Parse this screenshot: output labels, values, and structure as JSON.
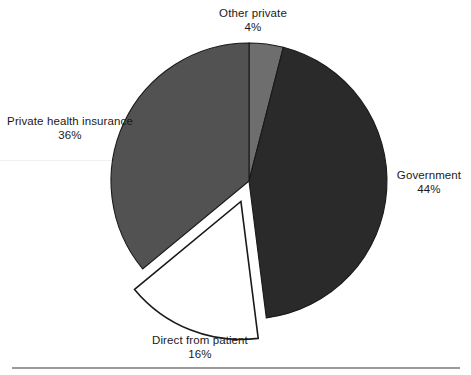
{
  "chart_data": {
    "type": "pie",
    "title": "",
    "subtitle": "",
    "xlabel": "",
    "ylabel": "",
    "legend_position": "none",
    "grid": false,
    "units": "percent",
    "total": 100,
    "start_angle_deg": 0,
    "direction": "clockwise",
    "categories": [
      "Other private",
      "Government",
      "Direct from patient",
      "Private health insurance"
    ],
    "values": [
      4,
      44,
      16,
      36
    ],
    "slices": [
      {
        "label": "Other private",
        "value": 4,
        "value_text": "4%",
        "color": "#6e6e6e",
        "exploded": false,
        "start_angle_deg": 0,
        "end_angle_deg": 14.4,
        "label_position": "top"
      },
      {
        "label": "Government",
        "value": 44,
        "value_text": "44%",
        "color": "#2a2a2a",
        "exploded": false,
        "start_angle_deg": 14.4,
        "end_angle_deg": 172.8,
        "label_position": "right"
      },
      {
        "label": "Direct from patient",
        "value": 16,
        "value_text": "16%",
        "color": "#ffffff",
        "stroke": "#1a1a1a",
        "exploded": true,
        "start_angle_deg": 172.8,
        "end_angle_deg": 230.4,
        "label_position": "bottom"
      },
      {
        "label": "Private health insurance",
        "value": 36,
        "value_text": "36%",
        "color": "#525252",
        "exploded": false,
        "start_angle_deg": 230.4,
        "end_angle_deg": 360,
        "label_position": "left"
      }
    ],
    "annotations": [
      {
        "name": "bottom-rule",
        "color": "#9a9a9a"
      }
    ]
  },
  "labels": {
    "other_private": {
      "name": "Other private",
      "value": "4%"
    },
    "government": {
      "name": "Government",
      "value": "44%"
    },
    "direct_from_patient": {
      "name": "Direct from patient",
      "value": "16%"
    },
    "private_health_insurance": {
      "name": "Private health insurance",
      "value": "36%"
    }
  },
  "colors": {
    "government": "#2a2a2a",
    "private_health_insurance": "#525252",
    "other_private": "#6e6e6e",
    "direct_from_patient": "#ffffff",
    "outline": "#1a1a1a",
    "rule": "#9a9a9a",
    "background": "#ffffff",
    "text": "#1a1a1a"
  }
}
